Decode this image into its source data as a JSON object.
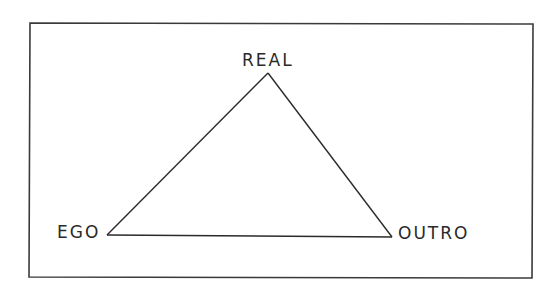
{
  "diagram": {
    "type": "triangle",
    "frame": {
      "x1": 30,
      "y1": 23,
      "x2": 533,
      "y2": 278,
      "stroke": "#3a3a3a"
    },
    "line_color": "#2a2a2a",
    "nodes": [
      {
        "id": "real",
        "label": "REAL",
        "x": 268,
        "y": 73,
        "position": "top"
      },
      {
        "id": "ego",
        "label": "EGO",
        "x": 107,
        "y": 235,
        "position": "bottom-left"
      },
      {
        "id": "outro",
        "label": "OUTRO",
        "x": 392,
        "y": 237,
        "position": "bottom-right"
      }
    ],
    "edges": [
      {
        "from": "ego",
        "to": "real"
      },
      {
        "from": "real",
        "to": "outro"
      },
      {
        "from": "ego",
        "to": "outro"
      }
    ]
  }
}
